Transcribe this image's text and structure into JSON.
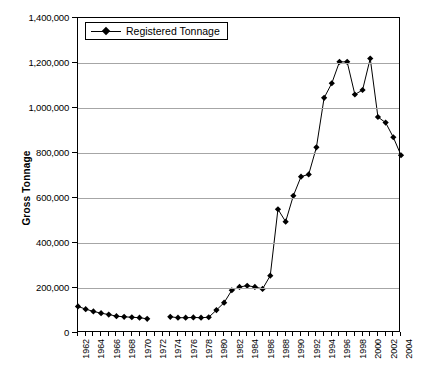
{
  "chart_data": {
    "type": "line",
    "title": "",
    "xlabel": "",
    "ylabel": "Gross Tonnage",
    "ylim": [
      0,
      1400000
    ],
    "ytick_values": [
      0,
      200000,
      400000,
      600000,
      800000,
      1000000,
      1200000,
      1400000
    ],
    "ytick_labels": [
      "0",
      "200,000",
      "400,000",
      "600,000",
      "800,000",
      "1,000,000",
      "1,200,000",
      "1,400,000"
    ],
    "grid": "horizontal",
    "legend_position": "top-left-inside",
    "legend_entries": [
      "Registered Tonnage"
    ],
    "xlim": [
      1962,
      2004
    ],
    "x": [
      1962,
      1963,
      1964,
      1965,
      1966,
      1967,
      1968,
      1969,
      1970,
      1971,
      1972,
      1973,
      1974,
      1975,
      1976,
      1977,
      1978,
      1979,
      1980,
      1981,
      1982,
      1983,
      1984,
      1985,
      1986,
      1987,
      1988,
      1989,
      1990,
      1991,
      1992,
      1993,
      1994,
      1995,
      1996,
      1997,
      1998,
      1999,
      2000,
      2001,
      2002,
      2003,
      2004
    ],
    "xtick_labels": [
      "1962",
      "1964",
      "1966",
      "1968",
      "1970",
      "1972",
      "1974",
      "1976",
      "1978",
      "1980",
      "1982",
      "1984",
      "1986",
      "1988",
      "1990",
      "1992",
      "1994",
      "1996",
      "1998",
      "2000",
      "2002",
      "2004"
    ],
    "series": [
      {
        "name": "Registered Tonnage",
        "marker": "diamond",
        "color": "#000000",
        "values": [
          118000,
          106000,
          96000,
          88000,
          82000,
          75000,
          72000,
          70000,
          68000,
          63000,
          null,
          null,
          72000,
          68000,
          68000,
          69000,
          68000,
          70000,
          102000,
          135000,
          190000,
          205000,
          210000,
          205000,
          196000,
          255000,
          550000,
          495000,
          610000,
          695000,
          705000,
          825000,
          1045000,
          1110000,
          1205000,
          1205000,
          1060000,
          1080000,
          1220000,
          960000,
          935000,
          870000,
          790000
        ]
      }
    ]
  },
  "axis": {
    "y_title": "Gross Tonnage"
  },
  "legend": {
    "label": "Registered Tonnage"
  }
}
